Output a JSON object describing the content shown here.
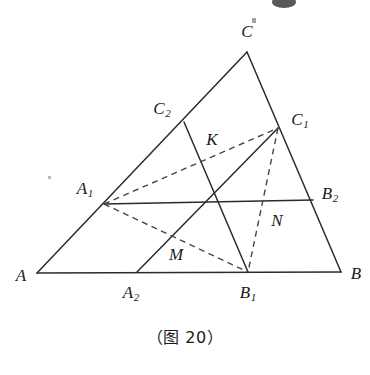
{
  "figure": {
    "caption": "（图 20）",
    "canvas": {
      "width": 370,
      "height": 375
    },
    "points": {
      "A": {
        "label": "A",
        "sub": "",
        "x": 37,
        "y": 273,
        "label_x": 21,
        "label_y": 275
      },
      "B": {
        "label": "B",
        "sub": "",
        "x": 341,
        "y": 272,
        "label_x": 356,
        "label_y": 273
      },
      "C": {
        "label": "C",
        "sub": "",
        "x": 247,
        "y": 52,
        "label_x": 247,
        "label_y": 31
      },
      "A1": {
        "label": "A",
        "sub": "1",
        "x": 104,
        "y": 204,
        "label_x": 85,
        "label_y": 188
      },
      "A2": {
        "label": "A",
        "sub": "2",
        "x": 137,
        "y": 272,
        "label_x": 131,
        "label_y": 292
      },
      "B1": {
        "label": "B",
        "sub": "1",
        "x": 248,
        "y": 272,
        "label_x": 248,
        "label_y": 292
      },
      "B2": {
        "label": "B",
        "sub": "2",
        "x": 313,
        "y": 200,
        "label_x": 330,
        "label_y": 193
      },
      "C1": {
        "label": "C",
        "sub": "1",
        "x": 278,
        "y": 128,
        "label_x": 300,
        "label_y": 119
      },
      "C2": {
        "label": "C",
        "sub": "2",
        "x": 184,
        "y": 122,
        "label_x": 162,
        "label_y": 108
      },
      "K": {
        "label": "K",
        "sub": "",
        "x": 205,
        "y": 158,
        "label_x": 212,
        "label_y": 139
      },
      "M": {
        "label": "M",
        "sub": "",
        "x": 172,
        "y": 237,
        "label_x": 176,
        "label_y": 254
      },
      "N": {
        "label": "N",
        "sub": "",
        "x": 266,
        "y": 204,
        "label_x": 277,
        "label_y": 220
      }
    },
    "segments": [
      {
        "name": "side-AB",
        "from": "A",
        "to": "B",
        "style": "solid"
      },
      {
        "name": "side-AC",
        "from": "A",
        "to": "C",
        "style": "solid"
      },
      {
        "name": "side-CB",
        "from": "C",
        "to": "B",
        "style": "solid"
      },
      {
        "name": "cevian-A1-B2",
        "from": "A1",
        "to": "B2",
        "style": "solid"
      },
      {
        "name": "cevian-C2-B1",
        "from": "C2",
        "to": "B1",
        "style": "solid"
      },
      {
        "name": "cevian-A2-C1",
        "from": "A2",
        "to": "C1",
        "style": "solid"
      },
      {
        "name": "chord-A1-C1",
        "from": "A1",
        "to": "C1",
        "style": "dashed"
      },
      {
        "name": "chord-A1-B1",
        "from": "A1",
        "to": "B1",
        "style": "dashed"
      },
      {
        "name": "chord-C1-B1",
        "from": "C1",
        "to": "B1",
        "style": "dashed"
      }
    ],
    "colors": {
      "solid_stroke": "#2b2b2f",
      "dashed_stroke": "#45454b",
      "label_color": "#19191d",
      "background": "#ffffff"
    }
  }
}
